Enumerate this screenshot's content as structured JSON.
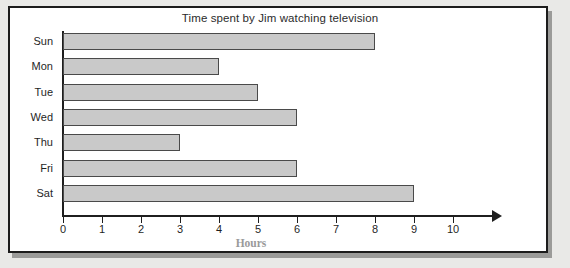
{
  "figure": {
    "frame_border_color": "#1c1c1c",
    "background": "#e9e9e7",
    "plot_background": "#ffffff"
  },
  "chart_data": {
    "type": "bar",
    "orientation": "horizontal",
    "title": "Time spent by Jim watching television",
    "xlabel": "Hours",
    "ylabel": "",
    "categories": [
      "Sun",
      "Mon",
      "Tue",
      "Wed",
      "Thu",
      "Fri",
      "Sat"
    ],
    "values": [
      8,
      4,
      5,
      6,
      3,
      6,
      9
    ],
    "xlim": [
      0,
      11
    ],
    "xticks": [
      0,
      1,
      2,
      3,
      4,
      5,
      6,
      7,
      8,
      9,
      10
    ],
    "xtick_labels": [
      "0",
      "1",
      "2",
      "3",
      "4",
      "5",
      "6",
      "7",
      "8",
      "9",
      "10"
    ],
    "grid": false,
    "legend": false,
    "bar_fill_color": "#c9c9c9",
    "bar_edge_color": "#4a4a4a",
    "axis_color": "#1f1f1f",
    "xlabel_color": "#9a9a9a",
    "series": [
      {
        "name": "Hours watched",
        "values": [
          8,
          4,
          5,
          6,
          3,
          6,
          9
        ]
      }
    ]
  }
}
